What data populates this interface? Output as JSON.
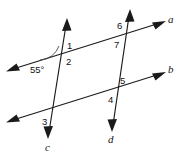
{
  "diagram": {
    "type": "geometry-transversals",
    "background_color": "#ffffff",
    "stroke_color": "#1a1a1a",
    "lines": [
      {
        "id": "a",
        "label": "a",
        "label_x": 168,
        "label_y": 14,
        "orientation": "rising-right",
        "role": "parallel-line-upper"
      },
      {
        "id": "b",
        "label": "b",
        "label_x": 168,
        "label_y": 64,
        "orientation": "rising-right",
        "role": "parallel-line-lower"
      },
      {
        "id": "c",
        "label": "c",
        "label_x": 45,
        "label_y": 142,
        "orientation": "falling-right",
        "role": "transversal-left"
      },
      {
        "id": "d",
        "label": "d",
        "label_x": 108,
        "label_y": 134,
        "orientation": "falling-right",
        "role": "transversal-right"
      }
    ],
    "angle_labels": [
      {
        "id": "1",
        "text": "1",
        "x": 67,
        "y": 41,
        "at_intersection": "line-a-and-line-c",
        "position": "above-right"
      },
      {
        "id": "2",
        "text": "2",
        "x": 66,
        "y": 57,
        "at_intersection": "line-a-and-line-c",
        "position": "below-right"
      },
      {
        "id": "3",
        "text": "3",
        "x": 42,
        "y": 117,
        "at_intersection": "line-b-and-line-c",
        "position": "below-left"
      },
      {
        "id": "4",
        "text": "4",
        "x": 108,
        "y": 95,
        "at_intersection": "line-b-and-line-d",
        "position": "below-left"
      },
      {
        "id": "5",
        "text": "5",
        "x": 120,
        "y": 76,
        "at_intersection": "line-b-and-line-d",
        "position": "above-right"
      },
      {
        "id": "6",
        "text": "6",
        "x": 117,
        "y": 21,
        "at_intersection": "line-a-and-line-d",
        "position": "above-left"
      },
      {
        "id": "7",
        "text": "7",
        "x": 114,
        "y": 40,
        "at_intersection": "line-a-and-line-d",
        "position": "below-left"
      }
    ],
    "measured_angle": {
      "text": "55°",
      "value": 55,
      "unit": "degrees",
      "x": 30,
      "y": 65,
      "at_intersection": "line-a-and-line-c",
      "position": "left-below",
      "arc_marked": true
    }
  }
}
